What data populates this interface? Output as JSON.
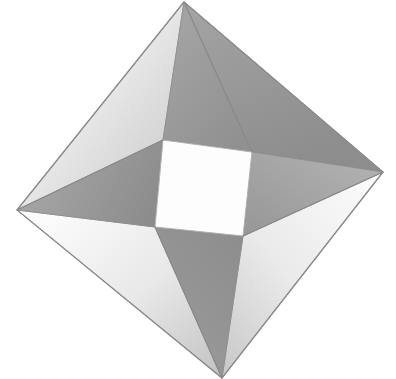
{
  "document": {
    "title": "Pythagorean pinwheel square figure",
    "background_color": "#ffffff",
    "width": 396,
    "height": 379
  },
  "figure": {
    "name": "tilted-square-with-four-right-triangles",
    "outline_color": "#8d8d8d",
    "outline_width": 1.2,
    "outer_square": {
      "name": "outer-tilted-square",
      "points": "184,2 383,172 222,378 17,210",
      "vertices": [
        {
          "label": "top",
          "x": 184,
          "y": 2
        },
        {
          "label": "right",
          "x": 383,
          "y": 172
        },
        {
          "label": "bottom",
          "x": 222,
          "y": 378
        },
        {
          "label": "left",
          "x": 17,
          "y": 210
        }
      ]
    },
    "inner_square": {
      "name": "inner-white-square",
      "fill": "#fdfdfd",
      "points": "163,140 252,152 243,236 155,227",
      "vertices": [
        {
          "label": "inner-top-left",
          "x": 163,
          "y": 140
        },
        {
          "label": "inner-top-right",
          "x": 252,
          "y": 152
        },
        {
          "label": "inner-bottom-right",
          "x": 243,
          "y": 236
        },
        {
          "label": "inner-bottom-left",
          "x": 155,
          "y": 227
        }
      ]
    },
    "triangles": [
      {
        "id": "triangle-top-right",
        "label": "upper right triangle",
        "points": "184,2 383,172 252,152",
        "fill_start": "#9d9d9d",
        "fill_end": "#8f8f8f",
        "tone": "mid-gray",
        "gradient_angle_deg": 110
      },
      {
        "id": "triangle-right-bottom",
        "label": "lower right triangle",
        "points": "383,172 222,378 243,236",
        "fill_start": "#fbfbfb",
        "fill_end": "#cfcfcf",
        "tone": "light",
        "gradient_angle_deg": 200
      },
      {
        "id": "triangle-bottom-left",
        "label": "lower left triangle",
        "points": "222,378 17,210 155,227",
        "fill_start": "#f7f7f7",
        "fill_end": "#c4c4c4",
        "tone": "light",
        "gradient_angle_deg": 20
      },
      {
        "id": "triangle-left-top",
        "label": "upper left triangle",
        "points": "17,210 184,2 163,140",
        "fill_start": "#fcfcfc",
        "fill_end": "#c9c9c9",
        "tone": "light",
        "gradient_angle_deg": 300
      }
    ],
    "quads": [
      {
        "id": "quad-top",
        "label": "top inner band",
        "points": "184,2 252,152 163,140",
        "fill_start": "#a2a2a2",
        "fill_end": "#939393",
        "tone": "mid-gray"
      },
      {
        "id": "quad-right",
        "label": "right inner band",
        "points": "383,172 243,236 252,152",
        "fill_start": "#b2b2b2",
        "fill_end": "#9a9a9a",
        "tone": "mid-gray"
      },
      {
        "id": "quad-bottom",
        "label": "bottom inner band",
        "points": "222,378 155,227 243,236",
        "fill_start": "#a0a0a0",
        "fill_end": "#8e8e8e",
        "tone": "mid-gray"
      },
      {
        "id": "quad-left",
        "label": "left inner band",
        "points": "17,210 163,140 155,227",
        "fill_start": "#a6a6a6",
        "fill_end": "#8c8c8c",
        "tone": "mid-gray"
      }
    ]
  }
}
